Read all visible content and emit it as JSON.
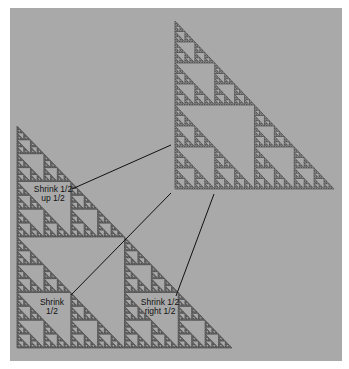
{
  "diagram": {
    "colors": {
      "background": "#ffffff",
      "panel": "#a9a9a9",
      "fractal": "#3a3a3a",
      "line": "#111111",
      "text": "#111111"
    },
    "big_triangle": {
      "x": 175,
      "y": 21,
      "w": 159,
      "h": 168
    },
    "composite_triangle": {
      "x": 17,
      "y": 126,
      "w": 215,
      "h": 222
    },
    "labels": [
      {
        "id": "up",
        "line1": "Shrink 1/2",
        "line2": "up 1/2",
        "cx": 53,
        "cy": 185
      },
      {
        "id": "shrink",
        "line1": "Shrink",
        "line2": "1/2",
        "cx": 52,
        "cy": 298
      },
      {
        "id": "right",
        "line1": "Shrink 1/2",
        "line2": "right 1/2",
        "cx": 160,
        "cy": 298
      }
    ],
    "connectors": [
      {
        "from": [
          72,
          189
        ],
        "to": [
          171,
          145
        ]
      },
      {
        "from": [
          71,
          295
        ],
        "to": [
          171,
          193
        ]
      },
      {
        "from": [
          176,
          296
        ],
        "to": [
          214,
          194
        ]
      }
    ]
  }
}
